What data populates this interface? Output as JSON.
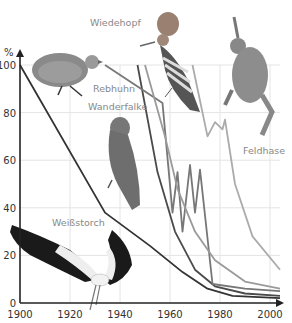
{
  "chart_data": {
    "type": "line",
    "title": "",
    "xlabel": "",
    "ylabel": "%",
    "xlim": [
      1900,
      2005
    ],
    "ylim": [
      0,
      100
    ],
    "x_ticks": [
      1900,
      1920,
      1940,
      1960,
      1980,
      2000
    ],
    "y_ticks": [
      0,
      20,
      40,
      60,
      80,
      100
    ],
    "grid": true,
    "legend": "labels placed next to lines with animal pictures",
    "series": [
      {
        "name": "Weißstorch",
        "color": "#333333",
        "points": [
          [
            1900,
            100
          ],
          [
            1934,
            38
          ],
          [
            1952,
            24
          ],
          [
            1965,
            13
          ],
          [
            1975,
            6
          ],
          [
            1985,
            3
          ],
          [
            2004,
            2
          ]
        ]
      },
      {
        "name": "Wanderfalke",
        "color": "#4a4a4a",
        "points": [
          [
            1947,
            100
          ],
          [
            1955,
            55
          ],
          [
            1962,
            30
          ],
          [
            1970,
            14
          ],
          [
            1978,
            7
          ],
          [
            1990,
            4
          ],
          [
            2004,
            3
          ]
        ]
      },
      {
        "name": "Rebhuhn",
        "color": "#777777",
        "points": [
          [
            1934,
            100
          ],
          [
            1957,
            84
          ],
          [
            1961,
            38
          ],
          [
            1963,
            55
          ],
          [
            1965,
            30
          ],
          [
            1968,
            58
          ],
          [
            1970,
            38
          ],
          [
            1972,
            56
          ],
          [
            1977,
            8
          ],
          [
            1990,
            6
          ],
          [
            2004,
            5
          ]
        ]
      },
      {
        "name": "Wiedehopf",
        "color": "#9a9a9a",
        "points": [
          [
            1950,
            100
          ],
          [
            1958,
            70
          ],
          [
            1963,
            48
          ],
          [
            1970,
            30
          ],
          [
            1978,
            18
          ],
          [
            1990,
            9
          ],
          [
            2004,
            6
          ]
        ]
      },
      {
        "name": "Feldhase",
        "color": "#ababab",
        "points": [
          [
            1969,
            100
          ],
          [
            1975,
            70
          ],
          [
            1978,
            76
          ],
          [
            1981,
            73
          ],
          [
            1982,
            77
          ],
          [
            1986,
            50
          ],
          [
            1993,
            28
          ],
          [
            2004,
            14
          ]
        ]
      }
    ],
    "labels": [
      {
        "text": "Wiedehopf",
        "x": 90,
        "y": 26
      },
      {
        "text": "Rebhuhn",
        "x": 93,
        "y": 92
      },
      {
        "text": "Wanderfalke",
        "x": 88,
        "y": 110
      },
      {
        "text": "Feldhase",
        "x": 243,
        "y": 154
      },
      {
        "text": "Weißstorch",
        "x": 52,
        "y": 226
      }
    ]
  },
  "axis": {
    "y_unit": "%"
  },
  "images": [
    "partridge",
    "hoopoe",
    "hare",
    "peregrine-falcon",
    "white-stork"
  ]
}
